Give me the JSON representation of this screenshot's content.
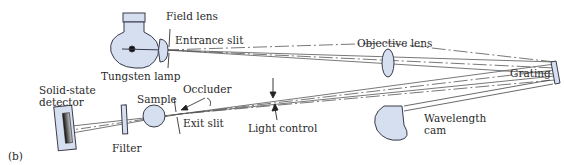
{
  "figure": {
    "panel_label": "(b)",
    "fill_color": "#d5dff0",
    "stroke_color": "#3a3a4a",
    "components": [
      {
        "id": "tungsten-lamp",
        "label": "Tungsten lamp"
      },
      {
        "id": "field-lens",
        "label": "Field lens"
      },
      {
        "id": "entrance-slit",
        "label": "Entrance slit"
      },
      {
        "id": "objective-lens",
        "label": "Objective lens"
      },
      {
        "id": "grating",
        "label": "Grating"
      },
      {
        "id": "wavelength-cam",
        "label_line1": "Wavelength",
        "label_line2": "cam"
      },
      {
        "id": "light-control",
        "label": "Light control"
      },
      {
        "id": "occluder",
        "label": "Occluder"
      },
      {
        "id": "exit-slit",
        "label": "Exit slit"
      },
      {
        "id": "sample",
        "label": "Sample"
      },
      {
        "id": "filter",
        "label": "Filter"
      },
      {
        "id": "solid-state-detector",
        "label_line1": "Solid-state",
        "label_line2": "detector"
      }
    ]
  }
}
